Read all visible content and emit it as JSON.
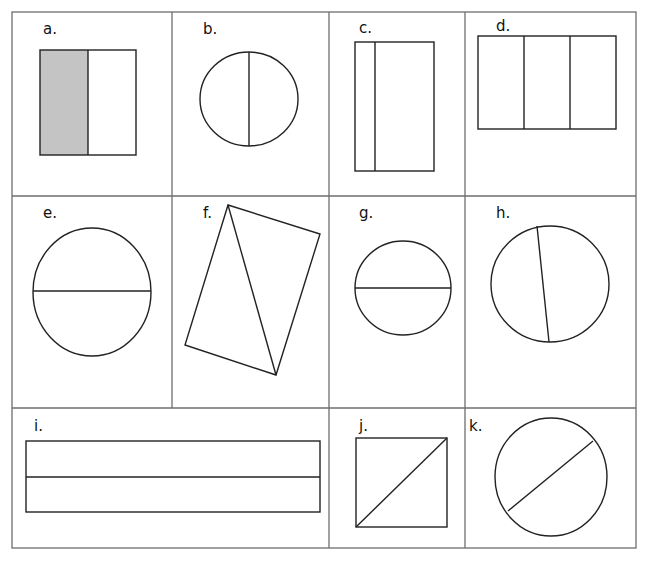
{
  "worksheet": {
    "grid_color": "#6e6e6e",
    "stroke_color": "#222222",
    "shade_color": "#c4c4c4",
    "cells": [
      {
        "label": "a.",
        "shape": "square",
        "divisions": "vertical-half",
        "shaded": "left half"
      },
      {
        "label": "b.",
        "shape": "circle",
        "divisions": "vertical-diameter"
      },
      {
        "label": "c.",
        "shape": "rectangle",
        "divisions": "vertical-unequal"
      },
      {
        "label": "d.",
        "shape": "rectangle",
        "divisions": "vertical-thirds"
      },
      {
        "label": "e.",
        "shape": "circle",
        "divisions": "horizontal-diameter"
      },
      {
        "label": "f.",
        "shape": "tilted-rectangle",
        "divisions": "diagonal"
      },
      {
        "label": "g.",
        "shape": "circle",
        "divisions": "horizontal-diameter"
      },
      {
        "label": "h.",
        "shape": "circle",
        "divisions": "tilted-diameter"
      },
      {
        "label": "i.",
        "shape": "long-rectangle",
        "divisions": "horizontal-half"
      },
      {
        "label": "j.",
        "shape": "square",
        "divisions": "diagonal"
      },
      {
        "label": "k.",
        "shape": "oval",
        "divisions": "diagonal-chord"
      }
    ]
  }
}
